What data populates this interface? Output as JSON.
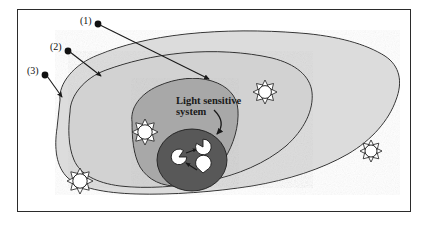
{
  "figure": {
    "title_text": "Light sensitive\nsystem",
    "background_color": "#ffffff",
    "frame_color": "#2b2b2b"
  },
  "labels": {
    "one": "(1)",
    "two": "(2)",
    "three": "(3)"
  },
  "regions": [
    {
      "id": "region-3-outer",
      "label_ref": "(3)",
      "fill": "#dcdcdc",
      "stroke": "#1e1e1e"
    },
    {
      "id": "region-2-middle",
      "label_ref": "(2)",
      "fill": "#d2d2d2",
      "stroke": "#1e1e1e"
    },
    {
      "id": "region-1-inner",
      "label_ref": "(1)",
      "fill": "#a8a8a8",
      "stroke": "#1e1e1e"
    },
    {
      "id": "core-dark",
      "label_ref": "",
      "fill": "#585858",
      "stroke": "#1e1e1e"
    }
  ],
  "sun_icons": [
    {
      "name": "sun-icon-top-right",
      "cx": 265,
      "cy": 92
    },
    {
      "name": "sun-icon-left-mid",
      "cx": 145,
      "cy": 132
    },
    {
      "name": "sun-icon-bottom-left",
      "cx": 80,
      "cy": 181
    },
    {
      "name": "sun-icon-right",
      "cx": 371,
      "cy": 151
    }
  ],
  "pacman_nodes": [
    {
      "name": "pacman-left",
      "cx": 179,
      "cy": 157
    },
    {
      "name": "pacman-top",
      "cx": 203,
      "cy": 147
    },
    {
      "name": "pacman-bottom",
      "cx": 203,
      "cy": 173
    }
  ],
  "leaders": [
    {
      "name": "leader-1",
      "from_label": "(1)",
      "dot": [
        98,
        24
      ],
      "tip": [
        211,
        81
      ]
    },
    {
      "name": "leader-2",
      "from_label": "(2)",
      "dot": [
        68,
        51
      ],
      "tip": [
        102,
        77
      ]
    },
    {
      "name": "leader-3",
      "from_label": "(3)",
      "dot": [
        45,
        75
      ],
      "tip": [
        63,
        99
      ]
    }
  ],
  "colors": {
    "light_gray": "#dcdcdc",
    "mid_gray": "#d2d2d2",
    "medium_gray": "#a8a8a8",
    "dark_gray": "#585858",
    "outline": "#1e1e1e",
    "white": "#ffffff"
  }
}
